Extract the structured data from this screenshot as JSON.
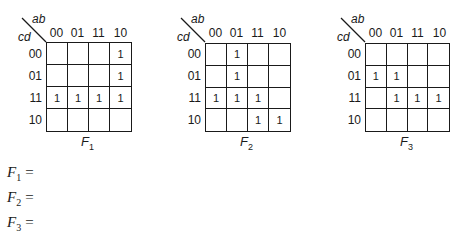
{
  "axis_labels": {
    "columns_var": "ab",
    "rows_var": "cd"
  },
  "column_codes": [
    "00",
    "01",
    "11",
    "10"
  ],
  "row_codes": [
    "00",
    "01",
    "11",
    "10"
  ],
  "kmaps": [
    {
      "name": "F",
      "subscript": "1",
      "cells": [
        [
          "",
          "",
          "",
          "1"
        ],
        [
          "",
          "",
          "",
          "1"
        ],
        [
          "1",
          "1",
          "1",
          "1"
        ],
        [
          "",
          "",
          "",
          ""
        ]
      ]
    },
    {
      "name": "F",
      "subscript": "2",
      "cells": [
        [
          "",
          "1",
          "",
          ""
        ],
        [
          "",
          "1",
          "",
          ""
        ],
        [
          "1",
          "1",
          "1",
          ""
        ],
        [
          "",
          "",
          "1",
          "1"
        ]
      ]
    },
    {
      "name": "F",
      "subscript": "3",
      "cells": [
        [
          "",
          "",
          "",
          ""
        ],
        [
          "1",
          "1",
          "",
          ""
        ],
        [
          "",
          "1",
          "1",
          "1"
        ],
        [
          "",
          "",
          "",
          ""
        ]
      ]
    }
  ],
  "equations": [
    {
      "name": "F",
      "subscript": "1",
      "equals": "="
    },
    {
      "name": "F",
      "subscript": "2",
      "equals": "="
    },
    {
      "name": "F",
      "subscript": "3",
      "equals": "="
    }
  ]
}
